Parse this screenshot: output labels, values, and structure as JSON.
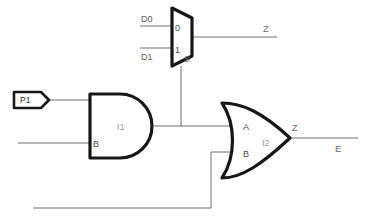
{
  "diagram": {
    "background_color": "#ffffff",
    "wire_color": "#6e6e73",
    "gate_outline_color": "#17171a"
  },
  "ports": {
    "input_tag": {
      "label": "P1",
      "shape": "pentagon-flag"
    }
  },
  "mux": {
    "instance_label": "",
    "input_labels": {
      "d0": "D0",
      "d1": "D1"
    },
    "data_pins": {
      "zero": "0",
      "one": "1"
    },
    "select_pin": "S",
    "output_net": "Z"
  },
  "and_gate": {
    "instance_label": "I1",
    "input_pin_b": "B",
    "type": "AND"
  },
  "or_gate": {
    "instance_label": "I2",
    "input_pin_a": "A",
    "input_pin_b": "B",
    "output_pin": "Z",
    "output_net": "E",
    "type": "OR"
  },
  "nets": [
    {
      "name": "Z",
      "location": "mux-output"
    },
    {
      "name": "E",
      "location": "or-output"
    }
  ]
}
